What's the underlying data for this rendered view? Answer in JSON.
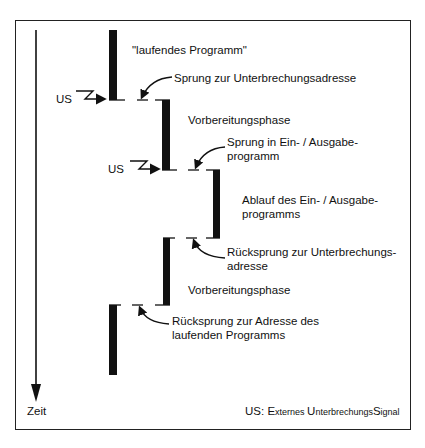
{
  "diagram": {
    "title": "",
    "time_axis_label": "Zeit",
    "signal_label": "US",
    "legend": {
      "abbr": "US:",
      "part1_big": "E",
      "part1_small": "xternes ",
      "part2_big": "U",
      "part2_small": "nterbrechungs",
      "part3_big": "S",
      "part3_small": "ignal"
    },
    "labels": {
      "running_program": "\"laufendes Programm\"",
      "jump_to_interrupt": "Sprung zur Unterbrechungsadresse",
      "preparation_1": "Vorbereitungsphase",
      "jump_to_io_line1": "Sprung in Ein- / Ausgabe-",
      "jump_to_io_line2": "programm",
      "io_execution_line1": "Ablauf des Ein- / Ausgabe-",
      "io_execution_line2": "programms",
      "return_to_interrupt_line1": "Rücksprung zur Unterbrechungs-",
      "return_to_interrupt_line2": "adresse",
      "preparation_2": "Vorbereitungsphase",
      "return_to_program_line1": "Rücksprung zur Adresse des",
      "return_to_program_line2": "laufenden Programms"
    },
    "phases": [
      {
        "name": "laufendes Programm",
        "level": 1,
        "y_start": 30,
        "y_end": 100
      },
      {
        "name": "Vorbereitungsphase",
        "level": 2,
        "y_start": 100,
        "y_end": 170
      },
      {
        "name": "Ein-/Ausgabeprogramm",
        "level": 3,
        "y_start": 170,
        "y_end": 238
      },
      {
        "name": "Vorbereitungsphase",
        "level": 2,
        "y_start": 238,
        "y_end": 305
      },
      {
        "name": "laufendes Programm",
        "level": 1,
        "y_start": 305,
        "y_end": 375
      }
    ],
    "colors": {
      "ink": "#111111",
      "background": "#ffffff"
    }
  }
}
